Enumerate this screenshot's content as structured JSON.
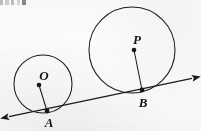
{
  "figure": {
    "background_color": "#fbfbfa",
    "stroke_color": "#1b1c20",
    "label_color": "#15161a"
  },
  "labels": {
    "center_small": "O",
    "center_large": "P",
    "tangent_point_small": "A",
    "tangent_point_large": "B"
  },
  "geometry": {
    "circle_small": {
      "cx": 43,
      "cy": 84,
      "r": 29
    },
    "circle_large": {
      "cx": 132,
      "cy": 50,
      "r": 43
    },
    "point_O": {
      "x": 39,
      "y": 85
    },
    "point_P": {
      "x": 134,
      "y": 50
    },
    "point_A": {
      "x": 47,
      "y": 111
    },
    "point_B": {
      "x": 142,
      "y": 90
    },
    "radius_OA": {
      "x1": 39,
      "y1": 85,
      "x2": 47,
      "y2": 111
    },
    "radius_PB": {
      "x1": 134,
      "y1": 50,
      "x2": 142,
      "y2": 90
    },
    "tangent_line": {
      "x1": 7,
      "y1": 117,
      "x2": 194,
      "y2": 78
    },
    "label_O_pos": {
      "x": 44,
      "y": 80
    },
    "label_P_pos": {
      "x": 137,
      "y": 44
    },
    "label_A_pos": {
      "x": 49,
      "y": 127
    },
    "label_B_pos": {
      "x": 143,
      "y": 107
    }
  },
  "artifact": {
    "top_crop_text_fragment": ""
  }
}
